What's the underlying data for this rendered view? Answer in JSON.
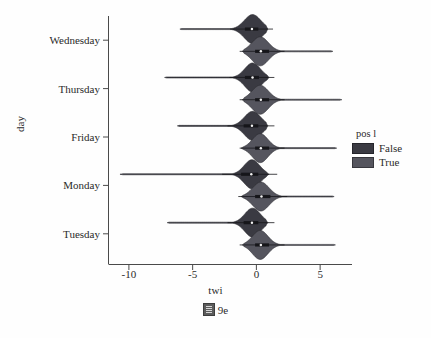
{
  "chart_data": {
    "type": "violin",
    "title": "",
    "xlabel": "twi",
    "ylabel": "day",
    "xlim": [
      -11.6,
      7.5
    ],
    "xticks": [
      -10,
      -5,
      0,
      5
    ],
    "xtick_labels": [
      "-10",
      "-5",
      "0",
      "5"
    ],
    "categories": [
      "Wednesday",
      "Thursday",
      "Friday",
      "Monday",
      "Tuesday"
    ],
    "grid": false,
    "orientation": "horizontal",
    "legend": {
      "title": "pos l",
      "position": "right",
      "entries": [
        {
          "label": "False",
          "color": "#3a3a42"
        },
        {
          "label": "True",
          "color": "#55555e"
        }
      ]
    },
    "series": [
      {
        "name": "False",
        "color": "#3a3a42",
        "groups": [
          {
            "category": "Wednesday",
            "min": -6.0,
            "max": 0.9,
            "median": -0.35,
            "q1": -0.9,
            "q3": 0.15,
            "peak": -0.3,
            "peak_width": 0.95
          },
          {
            "category": "Thursday",
            "min": -7.2,
            "max": 1.0,
            "median": -0.3,
            "q1": -0.9,
            "q3": 0.2,
            "peak": -0.3,
            "peak_width": 0.9
          },
          {
            "category": "Friday",
            "min": -6.2,
            "max": 0.9,
            "median": -0.35,
            "q1": -1.0,
            "q3": 0.15,
            "peak": -0.3,
            "peak_width": 0.95
          },
          {
            "category": "Monday",
            "min": -10.7,
            "max": 1.0,
            "median": -0.4,
            "q1": -1.2,
            "q3": 0.15,
            "peak": -0.35,
            "peak_width": 0.9
          },
          {
            "category": "Tuesday",
            "min": -7.0,
            "max": 0.9,
            "median": -0.35,
            "q1": -1.0,
            "q3": 0.15,
            "peak": -0.3,
            "peak_width": 0.9
          }
        ]
      },
      {
        "name": "True",
        "color": "#55555e",
        "groups": [
          {
            "category": "Wednesday",
            "min": -1.1,
            "max": 6.0,
            "median": 0.35,
            "q1": -0.1,
            "q3": 1.0,
            "peak": 0.3,
            "peak_width": 0.95
          },
          {
            "category": "Thursday",
            "min": -1.1,
            "max": 6.7,
            "median": 0.35,
            "q1": -0.1,
            "q3": 1.0,
            "peak": 0.3,
            "peak_width": 0.95
          },
          {
            "category": "Friday",
            "min": -1.2,
            "max": 6.3,
            "median": 0.35,
            "q1": -0.1,
            "q3": 1.0,
            "peak": 0.3,
            "peak_width": 0.9
          },
          {
            "category": "Monday",
            "min": -1.2,
            "max": 6.1,
            "median": 0.4,
            "q1": -0.1,
            "q3": 1.1,
            "peak": 0.35,
            "peak_width": 0.95
          },
          {
            "category": "Tuesday",
            "min": -1.1,
            "max": 6.2,
            "median": 0.35,
            "q1": -0.1,
            "q3": 1.0,
            "peak": 0.3,
            "peak_width": 0.9
          }
        ]
      }
    ]
  },
  "caption": {
    "glyph": "missing-glyph-box",
    "text": "9e"
  }
}
